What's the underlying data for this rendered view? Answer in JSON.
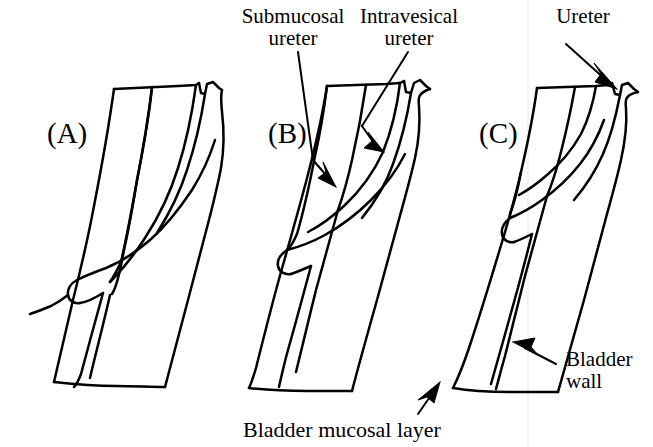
{
  "figure": {
    "background_color": "#ffffff",
    "ink_color": "#000000",
    "guide_line_color": "#e8e8e8"
  },
  "panels": [
    {
      "key": "a",
      "label": "(A)"
    },
    {
      "key": "b",
      "label": "(B)"
    },
    {
      "key": "c",
      "label": "(C)"
    }
  ],
  "callouts": {
    "submucosal": {
      "line1": "Submucosal",
      "line2": "ureter"
    },
    "intravesical": {
      "line1": "Intravesical",
      "line2": "ureter"
    },
    "ureter": {
      "line1": "Ureter"
    },
    "bladder_wall": {
      "line1": "Bladder",
      "line2": "wall"
    },
    "bladder_mucosal_layer": {
      "line1": "Bladder mucosal layer"
    }
  }
}
